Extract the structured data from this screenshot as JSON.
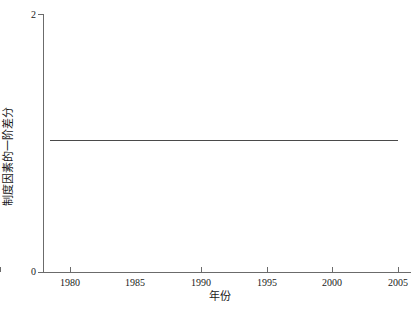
{
  "chart_data": {
    "type": "line",
    "title": "",
    "xlabel": "年份",
    "ylabel": "制度因素的一阶差分",
    "grid": false,
    "legend": false,
    "xlim": [
      1978.5,
      2006.0
    ],
    "ylim": [
      0,
      2
    ],
    "xticks": [
      1980,
      1985,
      1990,
      1995,
      2000,
      2005
    ],
    "xticklabels": [
      "1980",
      "1985",
      "1990",
      "1995",
      "2000",
      "2005"
    ],
    "yticks": [
      0,
      2
    ],
    "yticklabels": [
      "0",
      "2"
    ],
    "line_color": "#4a4a4a",
    "axis_color": "#6b6b6b",
    "background_color": "#ffffff",
    "series": [
      {
        "name": "制度因素的一阶差分",
        "x": [
          1979,
          1980,
          1981,
          1982,
          1983,
          1984,
          1985,
          1986,
          1987,
          1988,
          1989,
          1990,
          1991,
          1992,
          1993,
          1994,
          1995,
          1996,
          1997,
          1998,
          1999,
          2000,
          2001,
          2002,
          2003,
          2004,
          2005
        ],
        "values": [
          1.02,
          1.02,
          1.02,
          1.02,
          1.02,
          1.02,
          1.02,
          1.02,
          1.02,
          1.02,
          1.02,
          1.02,
          1.02,
          1.02,
          1.02,
          1.02,
          1.02,
          1.02,
          1.02,
          1.02,
          1.02,
          1.02,
          1.02,
          1.02,
          1.02,
          1.02,
          1.02
        ]
      }
    ]
  },
  "axes": {
    "y_tick_labels": [
      "2",
      "0"
    ],
    "x_tick_labels": [
      "1980",
      "1985",
      "1990",
      "1995",
      "2000",
      "2005"
    ],
    "x_title": "年份",
    "y_title": "制度因素的一阶差分"
  }
}
